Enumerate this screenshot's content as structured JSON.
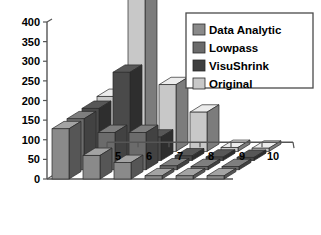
{
  "chart_data": {
    "type": "bar",
    "title": "",
    "xlabel": "",
    "ylabel": "",
    "categories": [
      "5",
      "6",
      "7",
      "8",
      "9",
      "10"
    ],
    "ylim": [
      0,
      400
    ],
    "yticks": [
      0,
      50,
      100,
      150,
      200,
      250,
      300,
      350,
      400
    ],
    "ytick_labels": [
      "0",
      "50",
      "100",
      "150",
      "200",
      "250",
      "300",
      "350",
      "400"
    ],
    "grid": false,
    "three_d": true,
    "legend_position": "top-right",
    "series": [
      {
        "name": "Data Analytic",
        "color": "#8a8a8a",
        "values": [
          128,
          60,
          42,
          8,
          6,
          5
        ]
      },
      {
        "name": "Lowpass",
        "color": "#6b6b6b",
        "values": [
          130,
          95,
          95,
          10,
          8,
          6
        ]
      },
      {
        "name": "VisuShrink",
        "color": "#4a4a4a",
        "values": [
          133,
          225,
          60,
          12,
          9,
          7
        ]
      },
      {
        "name": "Original",
        "color": "#c8c8c8",
        "values": [
          140,
          390,
          170,
          100,
          10,
          8
        ]
      }
    ]
  },
  "axis": {
    "y_tick_labels": [
      "400",
      "350",
      "300",
      "250",
      "200",
      "150",
      "100",
      "50",
      "0"
    ],
    "x_tick_labels": [
      "5",
      "6",
      "7",
      "8",
      "9",
      "10"
    ]
  },
  "legend": {
    "items": [
      {
        "label": "Data Analytic",
        "color": "#8a8a8a"
      },
      {
        "label": "Lowpass",
        "color": "#6b6b6b"
      },
      {
        "label": "VisuShrink",
        "color": "#3f3f3f"
      },
      {
        "label": "Original",
        "color": "#c8c8c8"
      }
    ]
  },
  "colors": {
    "background": "#ffffff",
    "axis": "#555555",
    "text": "#000000",
    "floor": "#ffffff",
    "legend_border": "#4a4a4a"
  }
}
